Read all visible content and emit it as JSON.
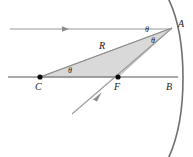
{
  "figure": {
    "type": "optics-ray-diagram",
    "colors": {
      "line": "#8c8c8c",
      "axis": "#8c8c8c",
      "mirror": "#7a7a7a",
      "triangle_fill": "#d9d9d9",
      "triangle_stroke": "#9a9a9a",
      "point": "#101010",
      "label": "#1a1a1a",
      "background": "#ffffff"
    },
    "labels": {
      "point_a": "A",
      "point_b": "B",
      "point_c": "C",
      "point_f": "F",
      "radius": "R",
      "theta_at_c": "θ",
      "theta_upper_at_a": "θ",
      "theta_lower_at_a": "θ"
    },
    "geometry": {
      "point_a": [
        172,
        28
      ],
      "point_b": [
        170,
        77
      ],
      "point_c": [
        40,
        77
      ],
      "point_f": [
        118,
        77
      ],
      "axis_start_x": 8,
      "axis_y": 77,
      "incident_ray_y": 29,
      "incident_ray_start_x": 10,
      "incident_ray_arrow_x": 65,
      "reflected_ray_end": [
        72,
        113
      ],
      "mirror_arc_top": [
        168,
        0
      ],
      "mirror_arc_bottom": [
        170,
        157
      ]
    }
  }
}
